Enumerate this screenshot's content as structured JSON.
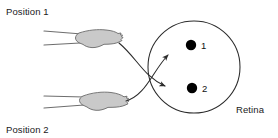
{
  "figure": {
    "background_color": "#ffffff",
    "width": 278,
    "height": 138
  },
  "labels": {
    "position_1": "Position 1",
    "position_2": "Position 2",
    "retina": "Retina"
  },
  "eye": {
    "shape": "circle",
    "center_x": 194,
    "center_y": 67,
    "radius": 46,
    "stroke_color": "#2b2b2b"
  },
  "image_points": [
    {
      "number": "1",
      "x": 191,
      "y": 45,
      "radius": 5.2,
      "color": "#000000",
      "source": "Position 2"
    },
    {
      "number": "2",
      "x": 192,
      "y": 88,
      "radius": 5.2,
      "color": "#000000",
      "source": "Position 1"
    }
  ],
  "hands": [
    {
      "name": "hand-position-1",
      "fill_color": "#c9c9c9",
      "outline_color": "#6a6a6a",
      "fingertip_x": 118,
      "fingertip_y": 42
    },
    {
      "name": "hand-position-2",
      "fill_color": "#c9c9c9",
      "outline_color": "#6a6a6a",
      "fingertip_x": 125,
      "fingertip_y": 100
    }
  ],
  "projection_arrows": [
    {
      "name": "arrow-position-1-to-dot-2",
      "from": "Position 1",
      "to_point": "2",
      "crosses": true
    },
    {
      "name": "arrow-position-2-to-dot-1",
      "from": "Position 2",
      "to_point": "1",
      "crosses": true
    }
  ]
}
